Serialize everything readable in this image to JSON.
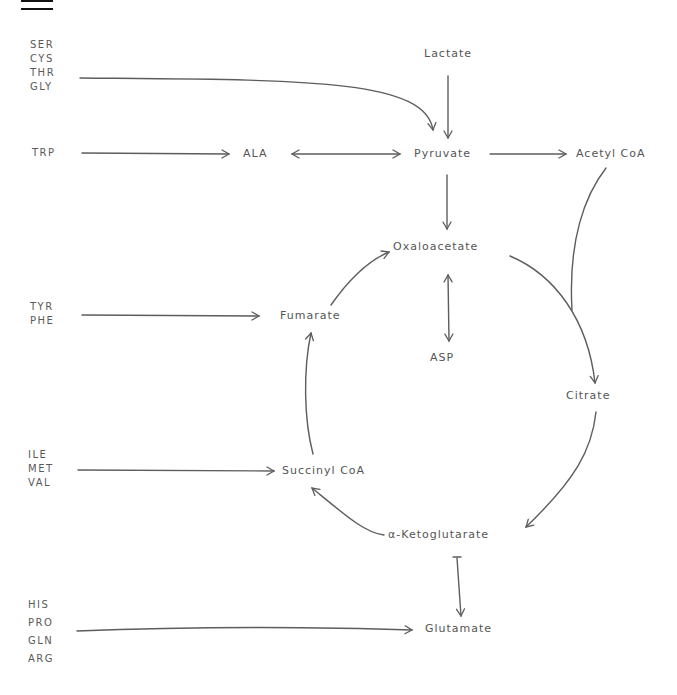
{
  "diagram": {
    "header_mark": "",
    "metabolites": {
      "lactate": "Lactate",
      "pyruvate": "Pyruvate",
      "acetyl_coa": "Acetyl CoA",
      "alanine": "ALA",
      "oxaloacetate": "Oxaloacetate",
      "aspartate": "ASP",
      "citrate": "Citrate",
      "fumarate": "Fumarate",
      "succinyl_coa": "Succinyl CoA",
      "alpha_ketoglutarate": "α-Ketoglutarate",
      "glutamate": "Glutamate"
    },
    "amino_acid_groups": {
      "to_pyruvate": [
        "SER",
        "CYS",
        "THR",
        "GLY"
      ],
      "to_alanine": [
        "TRP"
      ],
      "to_fumarate": [
        "TYR",
        "PHE"
      ],
      "to_succinyl_coa": [
        "ILE",
        "MET",
        "VAL"
      ],
      "to_glutamate": [
        "HIS",
        "PRO",
        "GLN",
        "ARG"
      ]
    },
    "edges": [
      {
        "from": "SER/CYS/THR/GLY",
        "to": "Pyruvate",
        "type": "arrow"
      },
      {
        "from": "Lactate",
        "to": "Pyruvate",
        "type": "arrow"
      },
      {
        "from": "TRP",
        "to": "ALA",
        "type": "arrow"
      },
      {
        "from": "ALA",
        "to": "Pyruvate",
        "type": "bidirectional"
      },
      {
        "from": "Pyruvate",
        "to": "Acetyl CoA",
        "type": "arrow"
      },
      {
        "from": "Pyruvate",
        "to": "Oxaloacetate",
        "type": "arrow"
      },
      {
        "from": "Oxaloacetate",
        "to": "ASP",
        "type": "bidirectional"
      },
      {
        "from": "Oxaloacetate + Acetyl CoA",
        "to": "Citrate",
        "type": "arrow"
      },
      {
        "from": "Citrate",
        "to": "α-Ketoglutarate",
        "type": "arrow"
      },
      {
        "from": "α-Ketoglutarate",
        "to": "Succinyl CoA",
        "type": "arrow"
      },
      {
        "from": "Succinyl CoA",
        "to": "Fumarate",
        "type": "arrow"
      },
      {
        "from": "Fumarate",
        "to": "Oxaloacetate",
        "type": "arrow"
      },
      {
        "from": "TYR/PHE",
        "to": "Fumarate",
        "type": "arrow"
      },
      {
        "from": "ILE/MET/VAL",
        "to": "Succinyl CoA",
        "type": "arrow"
      },
      {
        "from": "α-Ketoglutarate",
        "to": "Glutamate",
        "type": "bidirectional"
      },
      {
        "from": "HIS/PRO/GLN/ARG",
        "to": "Glutamate",
        "type": "arrow"
      }
    ]
  }
}
